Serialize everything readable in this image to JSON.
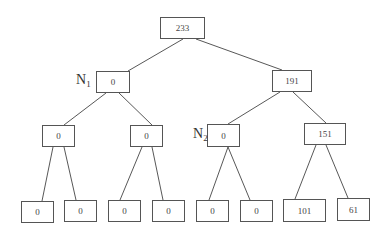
{
  "diagram": {
    "type": "binary-tree",
    "nodes": [
      {
        "id": "root",
        "value": "233",
        "x": 160,
        "y": 17,
        "w": 45,
        "h": 22
      },
      {
        "id": "n1",
        "value": "0",
        "x": 96,
        "y": 71,
        "w": 34,
        "h": 22
      },
      {
        "id": "n191",
        "value": "191",
        "x": 272,
        "y": 70,
        "w": 40,
        "h": 22
      },
      {
        "id": "l3a",
        "value": "0",
        "x": 42,
        "y": 125,
        "w": 33,
        "h": 22
      },
      {
        "id": "l3b",
        "value": "0",
        "x": 130,
        "y": 125,
        "w": 33,
        "h": 22
      },
      {
        "id": "n2",
        "value": "0",
        "x": 207,
        "y": 124,
        "w": 33,
        "h": 23
      },
      {
        "id": "n151",
        "value": "151",
        "x": 304,
        "y": 123,
        "w": 42,
        "h": 22
      },
      {
        "id": "leaf1",
        "value": "0",
        "x": 21,
        "y": 201,
        "w": 33,
        "h": 22
      },
      {
        "id": "leaf2",
        "value": "0",
        "x": 64,
        "y": 200,
        "w": 33,
        "h": 22
      },
      {
        "id": "leaf3",
        "value": "0",
        "x": 108,
        "y": 200,
        "w": 33,
        "h": 22
      },
      {
        "id": "leaf4",
        "value": "0",
        "x": 152,
        "y": 200,
        "w": 33,
        "h": 22
      },
      {
        "id": "leaf5",
        "value": "0",
        "x": 196,
        "y": 200,
        "w": 33,
        "h": 22
      },
      {
        "id": "leaf6",
        "value": "0",
        "x": 240,
        "y": 200,
        "w": 33,
        "h": 22
      },
      {
        "id": "leaf7",
        "value": "101",
        "x": 283,
        "y": 199,
        "w": 43,
        "h": 23
      },
      {
        "id": "leaf8",
        "value": "61",
        "x": 337,
        "y": 198,
        "w": 33,
        "h": 23
      }
    ],
    "labels": {
      "n1": {
        "main": "N",
        "sub": "1"
      },
      "n2": {
        "main": "N",
        "sub": "2"
      }
    }
  }
}
